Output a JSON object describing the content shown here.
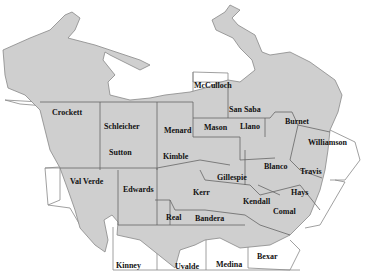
{
  "map": {
    "region_fill": "#cfcfcf",
    "county_line_color": "#555555",
    "outside_line_color": "#777777",
    "background": "#ffffff",
    "counties": [
      {
        "name": "Crockett",
        "x": 52,
        "y": 109
      },
      {
        "name": "Schleicher",
        "x": 104,
        "y": 123
      },
      {
        "name": "Menard",
        "x": 164,
        "y": 127
      },
      {
        "name": "McCulloch",
        "x": 194,
        "y": 82
      },
      {
        "name": "San Saba",
        "x": 229,
        "y": 106
      },
      {
        "name": "Mason",
        "x": 204,
        "y": 124
      },
      {
        "name": "Llano",
        "x": 240,
        "y": 123
      },
      {
        "name": "Burnet",
        "x": 285,
        "y": 118
      },
      {
        "name": "Williamson",
        "x": 308,
        "y": 139
      },
      {
        "name": "Sutton",
        "x": 109,
        "y": 149
      },
      {
        "name": "Kimble",
        "x": 163,
        "y": 153
      },
      {
        "name": "Blanco",
        "x": 264,
        "y": 163
      },
      {
        "name": "Travis",
        "x": 300,
        "y": 168
      },
      {
        "name": "Gillespie",
        "x": 217,
        "y": 174
      },
      {
        "name": "Val Verde",
        "x": 70,
        "y": 178
      },
      {
        "name": "Edwards",
        "x": 123,
        "y": 186
      },
      {
        "name": "Kerr",
        "x": 193,
        "y": 189
      },
      {
        "name": "Hays",
        "x": 291,
        "y": 189
      },
      {
        "name": "Kendall",
        "x": 243,
        "y": 198
      },
      {
        "name": "Comal",
        "x": 273,
        "y": 208
      },
      {
        "name": "Real",
        "x": 166,
        "y": 214
      },
      {
        "name": "Bandera",
        "x": 195,
        "y": 215
      },
      {
        "name": "Bexar",
        "x": 257,
        "y": 253
      },
      {
        "name": "Kinney",
        "x": 116,
        "y": 262
      },
      {
        "name": "Uvalde",
        "x": 175,
        "y": 263
      },
      {
        "name": "Medina",
        "x": 216,
        "y": 261
      }
    ]
  }
}
